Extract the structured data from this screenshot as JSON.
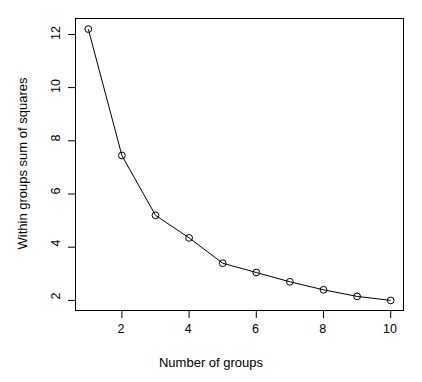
{
  "chart_data": {
    "type": "line",
    "title": "",
    "subtitle": "",
    "xlabel": "Number of groups",
    "ylabel": "Within groups sum of squares",
    "x": [
      1,
      2,
      3,
      4,
      5,
      6,
      7,
      8,
      9,
      10
    ],
    "values": [
      12.2,
      7.45,
      5.2,
      4.35,
      3.4,
      3.05,
      2.7,
      2.4,
      2.15,
      2.0
    ],
    "series": [
      {
        "name": "Within groups sum of squares",
        "values": [
          12.2,
          7.45,
          5.2,
          4.35,
          3.4,
          3.05,
          2.7,
          2.4,
          2.15,
          2.0
        ]
      }
    ],
    "xlim": [
      0.62,
      10.38
    ],
    "ylim": [
      1.62,
      12.6
    ],
    "xticks": [
      2,
      4,
      6,
      8,
      10
    ],
    "xtick_labels": [
      "2",
      "4",
      "6",
      "8",
      "10"
    ],
    "yticks": [
      2,
      4,
      6,
      8,
      10,
      12
    ],
    "ytick_labels": [
      "2",
      "4",
      "6",
      "8",
      "10",
      "12"
    ],
    "grid": false,
    "legend": false,
    "legend_position": "none",
    "marker": "open-circle",
    "line_color": "#000000",
    "marker_color": "#000000",
    "background_color": "#ffffff",
    "box_border": true,
    "annotations": []
  }
}
